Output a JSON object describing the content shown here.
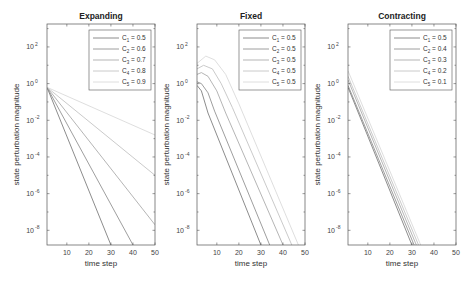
{
  "figure": {
    "width": 476,
    "height": 283
  },
  "chart_data": [
    {
      "type": "line",
      "title": "Expanding",
      "xlabel": "time step",
      "ylabel": "state perturbation magnitude",
      "yscale": "log",
      "xlim": [
        1,
        50
      ],
      "ylim_log10": [
        -8.8,
        3.25
      ],
      "xticks": [
        10,
        20,
        30,
        40,
        50
      ],
      "yticks_log10": [
        2,
        0,
        -2,
        -4,
        -6,
        -8
      ],
      "legend_position": "upper right",
      "series": [
        {
          "name": "C1 = 0.5",
          "sub": "1",
          "value": "0.5",
          "color": "#6e6e6e",
          "x": [
            1,
            30
          ],
          "log10y": [
            -0.2,
            -8.8
          ]
        },
        {
          "name": "C2 = 0.6",
          "sub": "2",
          "value": "0.6",
          "color": "#858585",
          "x": [
            1,
            40
          ],
          "log10y": [
            -0.2,
            -8.8
          ]
        },
        {
          "name": "C3 = 0.7",
          "sub": "3",
          "value": "0.7",
          "color": "#a2a2a2",
          "x": [
            1,
            50
          ],
          "log10y": [
            -0.2,
            -7.7
          ]
        },
        {
          "name": "C4 = 0.8",
          "sub": "4",
          "value": "0.8",
          "color": "#bdbdbd",
          "x": [
            1,
            50
          ],
          "log10y": [
            -0.2,
            -5.0
          ]
        },
        {
          "name": "C5 = 0.9",
          "sub": "5",
          "value": "0.9",
          "color": "#d6d6d6",
          "x": [
            1,
            50
          ],
          "log10y": [
            -0.2,
            -2.8
          ]
        }
      ]
    },
    {
      "type": "line",
      "title": "Fixed",
      "xlabel": "time step",
      "ylabel": "state perturbation magnitude",
      "yscale": "log",
      "xlim": [
        1,
        50
      ],
      "ylim_log10": [
        -8.8,
        3.25
      ],
      "xticks": [
        10,
        20,
        30,
        40,
        50
      ],
      "yticks_log10": [
        2,
        0,
        -2,
        -4,
        -6,
        -8
      ],
      "legend_position": "upper right",
      "series": [
        {
          "name": "C1 = 0.5",
          "sub": "1",
          "value": "0.5",
          "color": "#6e6e6e",
          "x": [
            1,
            3,
            6,
            30
          ],
          "log10y": [
            -0.1,
            -0.4,
            -1.6,
            -8.8
          ]
        },
        {
          "name": "C2 = 0.5",
          "sub": "2",
          "value": "0.5",
          "color": "#858585",
          "x": [
            1,
            3,
            6,
            9,
            34
          ],
          "log10y": [
            0.1,
            0.0,
            -0.5,
            -1.5,
            -8.8
          ]
        },
        {
          "name": "C3 = 0.5",
          "sub": "3",
          "value": "0.5",
          "color": "#a2a2a2",
          "x": [
            1,
            3,
            6,
            10,
            14,
            40
          ],
          "log10y": [
            0.5,
            0.6,
            0.4,
            -0.4,
            -1.6,
            -8.8
          ]
        },
        {
          "name": "C4 = 0.5",
          "sub": "4",
          "value": "0.5",
          "color": "#bdbdbd",
          "x": [
            1,
            4,
            8,
            12,
            17,
            44
          ],
          "log10y": [
            0.8,
            1.0,
            0.8,
            0.0,
            -1.3,
            -8.8
          ]
        },
        {
          "name": "C5 = 0.5",
          "sub": "5",
          "value": "0.5",
          "color": "#d6d6d6",
          "x": [
            1,
            5,
            9,
            14,
            20,
            47
          ],
          "log10y": [
            1.1,
            1.5,
            1.3,
            0.5,
            -1.1,
            -8.8
          ]
        }
      ]
    },
    {
      "type": "line",
      "title": "Contracting",
      "xlabel": "time step",
      "ylabel": "state perturbation magnitude",
      "yscale": "log",
      "xlim": [
        1,
        50
      ],
      "ylim_log10": [
        -8.8,
        3.25
      ],
      "xticks": [
        10,
        20,
        30,
        40,
        50
      ],
      "yticks_log10": [
        2,
        0,
        -2,
        -4,
        -6,
        -8
      ],
      "legend_position": "upper right",
      "series": [
        {
          "name": "C1 = 0.5",
          "sub": "1",
          "value": "0.5",
          "color": "#6e6e6e",
          "x": [
            1,
            30
          ],
          "log10y": [
            -0.2,
            -8.8
          ]
        },
        {
          "name": "C2 = 0.4",
          "sub": "2",
          "value": "0.4",
          "color": "#858585",
          "x": [
            1,
            31
          ],
          "log10y": [
            -0.1,
            -8.8
          ]
        },
        {
          "name": "C3 = 0.3",
          "sub": "3",
          "value": "0.3",
          "color": "#a2a2a2",
          "x": [
            1,
            32
          ],
          "log10y": [
            0.2,
            -8.8
          ]
        },
        {
          "name": "C4 = 0.2",
          "sub": "4",
          "value": "0.2",
          "color": "#bdbdbd",
          "x": [
            1,
            33
          ],
          "log10y": [
            0.4,
            -8.8
          ]
        },
        {
          "name": "C5 = 0.1",
          "sub": "5",
          "value": "0.1",
          "color": "#d6d6d6",
          "x": [
            1,
            34
          ],
          "log10y": [
            0.7,
            -8.8
          ]
        }
      ]
    }
  ],
  "panels_layout": [
    {
      "left": 47,
      "right": 155,
      "top": 24,
      "bottom": 245
    },
    {
      "left": 197,
      "right": 305,
      "top": 24,
      "bottom": 245
    },
    {
      "left": 348,
      "right": 456,
      "top": 24,
      "bottom": 245
    }
  ],
  "style": {
    "frame_color": "#555555",
    "text_color": "#333333"
  }
}
